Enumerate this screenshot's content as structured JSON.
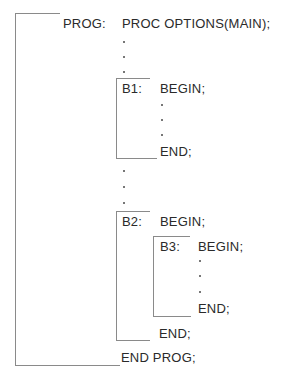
{
  "diagram": {
    "outer": {
      "label": "PROG:",
      "first_line": "PROC OPTIONS(MAIN);",
      "last_line": "END PROG;"
    },
    "blocks": [
      {
        "label": "B1:",
        "begin": "BEGIN;",
        "end": "END;"
      },
      {
        "label": "B2:",
        "begin": "BEGIN;",
        "end": "END;"
      },
      {
        "label": "B3:",
        "begin": "BEGIN;",
        "end": "END;"
      }
    ],
    "ellipsis": "."
  }
}
